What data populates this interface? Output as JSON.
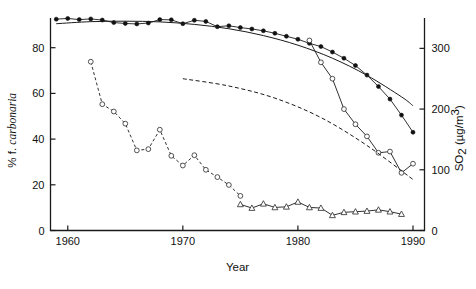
{
  "chart_data": {
    "type": "line",
    "title": "",
    "xlabel": "Year",
    "ylabel_left": "% f. carbonaria",
    "ylabel_left_plain": "% f. ",
    "ylabel_left_italic": "carbonaria",
    "ylabel_right": "SO2 (µg/m3)",
    "ylabel_right_base": "SO",
    "ylabel_right_sub": "2",
    "ylabel_right_units": " (µg/m",
    "ylabel_right_sup": "3",
    "ylabel_right_close": ")",
    "xlim": [
      1958.5,
      1991.0
    ],
    "ylim_left": [
      0,
      93
    ],
    "ylim_right": [
      0,
      350
    ],
    "grid": false,
    "legend": "none",
    "xticks": [
      1960,
      1970,
      1980,
      1990
    ],
    "xticklabels": [
      "1960",
      "1970",
      "1980",
      "1990"
    ],
    "yticks_left": [
      0,
      20,
      40,
      60,
      80
    ],
    "yticklabels_left": [
      "0",
      "20",
      "40",
      "60",
      "80"
    ],
    "yticks_right": [
      0,
      100,
      200,
      300
    ],
    "yticklabels_right": [
      "0",
      "100",
      "200",
      "300"
    ],
    "series": [
      {
        "name": "% f. carbonaria",
        "marker": "filled-circle",
        "linestyle": "solid",
        "axis": "left",
        "x": [
          1959,
          1960,
          1961,
          1962,
          1963,
          1964,
          1965,
          1966,
          1967,
          1968,
          1969,
          1970,
          1971,
          1972,
          1973,
          1974,
          1975,
          1976,
          1977,
          1978,
          1979,
          1980,
          1981,
          1982,
          1983,
          1984,
          1985,
          1986,
          1987,
          1988,
          1989,
          1990
        ],
        "y": [
          92.5,
          92.8,
          92.3,
          92.6,
          92.1,
          91.0,
          90.6,
          90.4,
          90.8,
          92.3,
          92.2,
          90.5,
          92.0,
          91.5,
          89.2,
          89.6,
          88.8,
          88.2,
          87.4,
          86.3,
          85.0,
          83.7,
          81.9,
          80.5,
          78.1,
          75.4,
          72.2,
          68.0,
          63.0,
          57.5,
          50.5,
          43.0
        ]
      },
      {
        "name": "SO2 old monitoring station",
        "marker": "open-circle",
        "linestyle": "dashed",
        "axis": "right",
        "x": [
          1962,
          1963,
          1964,
          1965,
          1966,
          1967,
          1968,
          1969,
          1970,
          1971,
          1972,
          1973,
          1974,
          1975
        ],
        "y": [
          278,
          208,
          196,
          176,
          132,
          134,
          166,
          123,
          107,
          124,
          100,
          88,
          75,
          57
        ]
      },
      {
        "name": "SO2 recent monitoring station",
        "marker": "open-circle",
        "linestyle": "solid",
        "axis": "right",
        "x": [
          1981,
          1982,
          1983,
          1984,
          1985,
          1986,
          1987,
          1988,
          1989,
          1990
        ],
        "y": [
          313,
          277,
          250,
          200,
          175,
          155,
          128,
          130,
          95,
          110
        ]
      },
      {
        "name": "SO2 urban triangles",
        "marker": "triangle",
        "linestyle": "solid",
        "axis": "right",
        "x": [
          1975,
          1976,
          1977,
          1978,
          1979,
          1980,
          1981,
          1982,
          1983,
          1984,
          1985,
          1986,
          1987,
          1988,
          1989
        ],
        "y": [
          43,
          37,
          44,
          38,
          39,
          47,
          38,
          37,
          25,
          30,
          31,
          32,
          34,
          31,
          27
        ]
      },
      {
        "name": "fitted curve carbonaria",
        "marker": "none",
        "linestyle": "solid-fit",
        "axis": "left",
        "x": [
          1959,
          1962,
          1965,
          1968,
          1971,
          1974,
          1977,
          1980,
          1983,
          1986,
          1989,
          1990
        ],
        "y": [
          90.5,
          91.4,
          91.6,
          91.3,
          90.2,
          88.3,
          85.3,
          81.1,
          75.4,
          67.9,
          58.5,
          54.6
        ]
      },
      {
        "name": "fitted curve SO2 projection",
        "marker": "none",
        "linestyle": "dashed-fit",
        "axis": "right",
        "x": [
          1970,
          1974,
          1978,
          1982,
          1986,
          1990
        ],
        "y": [
          250,
          238,
          218,
          186,
          140,
          84
        ]
      }
    ],
    "annotations": []
  }
}
